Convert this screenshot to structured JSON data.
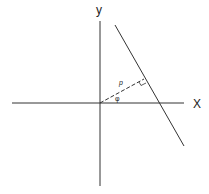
{
  "diagram": {
    "title": "",
    "type": "normal-form line diagram",
    "axes": {
      "x_label": "X",
      "y_label": "y"
    },
    "labels": {
      "normal_length": "p",
      "angle": "φ"
    },
    "elements": [
      {
        "id": "x-axis",
        "kind": "line",
        "style": "solid"
      },
      {
        "id": "y-axis",
        "kind": "line",
        "style": "solid"
      },
      {
        "id": "slanted-line",
        "kind": "line",
        "style": "solid"
      },
      {
        "id": "normal-segment",
        "kind": "line",
        "style": "dashed",
        "from": "origin",
        "to": "foot-of-perpendicular"
      },
      {
        "id": "right-angle-marker",
        "kind": "marker"
      }
    ],
    "colors": {
      "stroke": "#333333",
      "background": "#ffffff"
    }
  }
}
